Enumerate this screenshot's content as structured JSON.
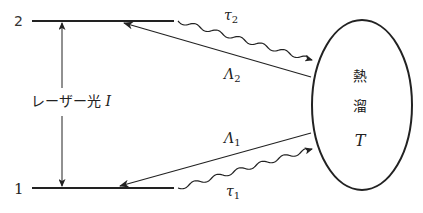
{
  "diagram": {
    "levels": {
      "upper": {
        "label": "2"
      },
      "lower": {
        "label": "1"
      }
    },
    "laser": {
      "text": "レーザー光 ",
      "symbol": "I"
    },
    "reservoir": {
      "line1": "熱",
      "line2": "溜",
      "symbol": "T"
    },
    "transitions": {
      "tau2": {
        "base": "τ",
        "sub": "2"
      },
      "lambda2": {
        "base": "Λ",
        "sub": "2"
      },
      "lambda1": {
        "base": "Λ",
        "sub": "1"
      },
      "tau1": {
        "base": "τ",
        "sub": "1"
      }
    },
    "colors": {
      "ink": "#222222",
      "background": "#ffffff"
    }
  }
}
